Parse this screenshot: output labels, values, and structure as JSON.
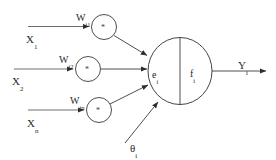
{
  "figure": {
    "kind": "artificial-neuron-diagram",
    "background_color": "#ffffff",
    "line_color": "#3a3a3a",
    "text_color": "#2a2a2a"
  },
  "inputs": [
    {
      "label_base": "X",
      "label_sub": "1"
    },
    {
      "label_base": "X",
      "label_sub": "2"
    },
    {
      "label_base": "X",
      "label_sub": "n"
    }
  ],
  "weights": [
    {
      "label_base": "W",
      "label_sub": "i1"
    },
    {
      "label_base": "W",
      "label_sub": "i2"
    },
    {
      "label_base": "W",
      "label_sub": "in"
    }
  ],
  "multiplier_nodes": [
    {
      "symbol": "*"
    },
    {
      "symbol": "*"
    },
    {
      "symbol": "*"
    }
  ],
  "body": {
    "left_label_base": "e",
    "left_label_sub": "i",
    "right_label_base": "f",
    "right_label_sub": "i"
  },
  "threshold": {
    "label_base": "θ",
    "label_sub": "i"
  },
  "output": {
    "label_base": "Y",
    "label_sub": "i"
  }
}
